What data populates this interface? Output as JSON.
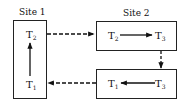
{
  "sites": [
    {
      "label": "Site 1"
    },
    {
      "label": "Site 2"
    }
  ],
  "site1": {
    "nodes": [
      {
        "name": "T",
        "sub": "2"
      },
      {
        "name": "T",
        "sub": "1"
      }
    ]
  },
  "site2_top": {
    "nodes": [
      {
        "name": "T",
        "sub": "2"
      },
      {
        "name": "T",
        "sub": "3"
      }
    ]
  },
  "site2_bottom": {
    "nodes": [
      {
        "name": "T",
        "sub": "1"
      },
      {
        "name": "T",
        "sub": "3"
      }
    ]
  },
  "edges": [
    {
      "from": "Site1.T1",
      "to": "Site1.T2",
      "style": "solid"
    },
    {
      "from": "Site1.T2",
      "to": "Site2.T2",
      "style": "dashed"
    },
    {
      "from": "Site2.T2",
      "to": "Site2.T3",
      "style": "solid"
    },
    {
      "from": "Site2 top box",
      "to": "Site2 bottom box",
      "style": "dashed"
    },
    {
      "from": "Site2.T3",
      "to": "Site2.T1",
      "style": "solid"
    },
    {
      "from": "Site2.T1",
      "to": "Site1.T1",
      "style": "dashed"
    }
  ]
}
